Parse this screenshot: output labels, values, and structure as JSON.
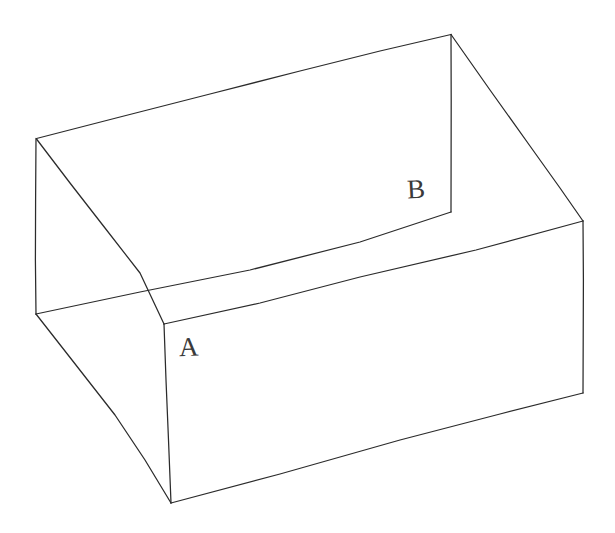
{
  "figure": {
    "style": "hand-drawn line drawing",
    "background_color": "#ffffff",
    "stroke_color": "#2b2b2b",
    "stroke_width": 1.25,
    "canvas": {
      "width": 615,
      "height": 533
    }
  },
  "labels": [
    {
      "id": "A",
      "text": "A",
      "x": 179,
      "y": 334,
      "anchor_vertex": "front-inner-top-corner",
      "anchor_x": 164,
      "anchor_y": 324
    },
    {
      "id": "B",
      "text": "B",
      "x": 407,
      "y": 176,
      "anchor_vertex": "back-inner-top-corner",
      "anchor_x": 451,
      "anchor_y": 212
    }
  ],
  "vertices": {
    "top_back_left": {
      "x": 36,
      "y": 138
    },
    "top_back_right": {
      "x": 451,
      "y": 34
    },
    "top_right": {
      "x": 583,
      "y": 221
    },
    "inner_A": {
      "x": 164,
      "y": 324
    },
    "inner_B": {
      "x": 451,
      "y": 212
    },
    "left_bottom_back": {
      "x": 36,
      "y": 314
    },
    "front_bottom": {
      "x": 171,
      "y": 503
    },
    "right_bottom": {
      "x": 583,
      "y": 393
    }
  },
  "edges": [
    {
      "name": "top-rim-back-left",
      "from": "top_back_left",
      "to": "top_back_right"
    },
    {
      "name": "top-rim-back-right",
      "from": "top_back_right",
      "to": "top_right"
    },
    {
      "name": "left-outer-vertical",
      "from": "top_back_left",
      "to": "left_bottom_back"
    },
    {
      "name": "right-outer-vertical",
      "from": "top_right",
      "to": "right_bottom"
    },
    {
      "name": "inner-rim-left",
      "from": "top_back_left",
      "to": "inner_A"
    },
    {
      "name": "inner-rim-right",
      "from": "top_back_right",
      "to": "inner_B"
    },
    {
      "name": "inner-floor-long",
      "from": "left_bottom_back",
      "to": "inner_B"
    },
    {
      "name": "inner-floor-front",
      "from": "inner_A",
      "to": "right_bottom"
    },
    {
      "name": "front-vertical",
      "from": "inner_A",
      "to": "front_bottom"
    },
    {
      "name": "bottom-front-left",
      "from": "left_bottom_back",
      "to": "front_bottom"
    },
    {
      "name": "bottom-front-right",
      "from": "front_bottom",
      "to": "right_bottom"
    },
    {
      "name": "inner-vertical-B",
      "from": "top_back_right",
      "to": "inner_B"
    }
  ],
  "crossings": [
    {
      "name": "left-crossing",
      "x": 140,
      "y": 292
    },
    {
      "name": "right-crossing",
      "x": 476,
      "y": 250
    }
  ]
}
